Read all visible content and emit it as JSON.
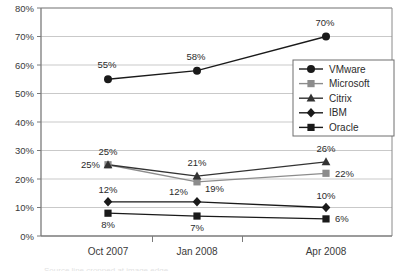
{
  "chart_data": {
    "type": "line",
    "title": "",
    "xlabel": "",
    "ylabel": "",
    "categories": [
      "Oct 2007",
      "Jan 2008",
      "Apr 2008"
    ],
    "ylim": [
      0,
      80
    ],
    "ytick_labels": [
      "0%",
      "10%",
      "20%",
      "30%",
      "40%",
      "50%",
      "60%",
      "70%",
      "80%"
    ],
    "ytick_values": [
      0,
      10,
      20,
      30,
      40,
      50,
      60,
      70,
      80
    ],
    "grid": true,
    "legend_position": "center-right",
    "series": [
      {
        "name": "VMware",
        "marker": "circle",
        "color": "#1a1a1a",
        "values": [
          55,
          58,
          70
        ],
        "labels": [
          "55%",
          "58%",
          "70%"
        ]
      },
      {
        "name": "Microsoft",
        "marker": "square",
        "color": "#8c8c8c",
        "values": [
          25,
          19,
          22
        ],
        "labels": [
          "25%",
          "19%",
          "22%"
        ]
      },
      {
        "name": "Citrix",
        "marker": "triangle",
        "color": "#333333",
        "values": [
          25,
          21,
          26
        ],
        "labels": [
          "25%",
          "21%",
          "26%"
        ]
      },
      {
        "name": "IBM",
        "marker": "diamond",
        "color": "#1a1a1a",
        "values": [
          12,
          12,
          10
        ],
        "labels": [
          "12%",
          "12%",
          "10%"
        ]
      },
      {
        "name": "Oracle",
        "marker": "square",
        "color": "#1a1a1a",
        "values": [
          8,
          7,
          6
        ],
        "labels": [
          "8%",
          "7%",
          "6%"
        ]
      }
    ]
  },
  "axis": {
    "y_ticks": [
      {
        "label": "80%"
      },
      {
        "label": "70%"
      },
      {
        "label": "60%"
      },
      {
        "label": "50%"
      },
      {
        "label": "40%"
      },
      {
        "label": "30%"
      },
      {
        "label": "20%"
      },
      {
        "label": "10%"
      },
      {
        "label": "0%"
      }
    ],
    "x_ticks": [
      {
        "label": "Oct 2007"
      },
      {
        "label": "Jan 2008"
      },
      {
        "label": "Apr 2008"
      }
    ]
  },
  "legend": {
    "items": [
      {
        "label": "VMware"
      },
      {
        "label": "Microsoft"
      },
      {
        "label": "Citrix"
      },
      {
        "label": "IBM"
      },
      {
        "label": "Oracle"
      }
    ]
  },
  "point_labels": [
    {
      "text": "55%"
    },
    {
      "text": "58%"
    },
    {
      "text": "70%"
    },
    {
      "text": "25%"
    },
    {
      "text": "19%"
    },
    {
      "text": "22%"
    },
    {
      "text": "25%"
    },
    {
      "text": "21%"
    },
    {
      "text": "26%"
    },
    {
      "text": "12%"
    },
    {
      "text": "12%"
    },
    {
      "text": "10%"
    },
    {
      "text": "8%"
    },
    {
      "text": "7%"
    },
    {
      "text": "6%"
    }
  ],
  "colors": {
    "axis": "#7a7a7a",
    "grid": "#c9c9c9",
    "plot_border": "#8a8a8a",
    "dark_series": "#1a1a1a",
    "gray_series": "#8c8c8c"
  },
  "footer": {
    "cropped_text": "Source line cropped at image edge"
  }
}
